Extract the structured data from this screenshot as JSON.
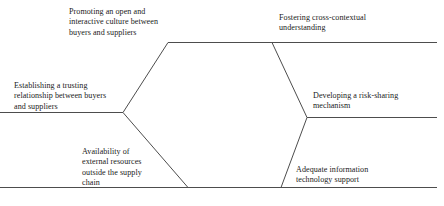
{
  "diagram": {
    "type": "hexagon-enablers",
    "stroke_color": "#4d4d4d",
    "text_color": "#1a1a1a",
    "background_color": "#ffffff",
    "labels": [
      {
        "id": "top-left",
        "text": "Promoting an open and\ninteractive culture between\nbuyers and suppliers"
      },
      {
        "id": "top-right",
        "text": "Fostering cross-contextual\nunderstanding"
      },
      {
        "id": "mid-left",
        "text": "Establishing a trusting\nrelationship between buyers\nand suppliers"
      },
      {
        "id": "mid-right",
        "text": "Developing a risk-sharing\nmechanism"
      },
      {
        "id": "bottom-left",
        "text": "Availability of\nexternal resources\noutside the supply\nchain"
      },
      {
        "id": "bottom-right",
        "text": "Adequate information\ntechnology support"
      }
    ]
  }
}
